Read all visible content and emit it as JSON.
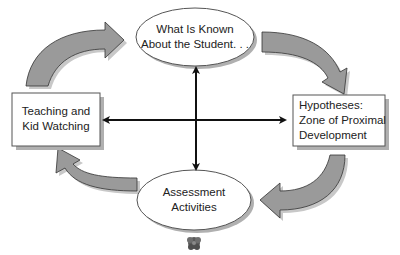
{
  "diagram": {
    "nodes": {
      "top": {
        "lines": [
          "What Is Known",
          "About the Student. . ."
        ],
        "shape": "ellipse"
      },
      "left": {
        "lines": [
          "Teaching and",
          "Kid Watching"
        ],
        "shape": "rectangle"
      },
      "right": {
        "lines": [
          "Hypotheses:",
          "Zone of Proximal",
          "Development"
        ],
        "shape": "rectangle"
      },
      "bottom": {
        "lines": [
          "Assessment",
          "Activities"
        ],
        "shape": "ellipse"
      }
    },
    "cycle_arrows": [
      {
        "from": "left",
        "to": "top",
        "direction": "clockwise"
      },
      {
        "from": "top",
        "to": "right",
        "direction": "clockwise"
      },
      {
        "from": "right",
        "to": "bottom",
        "direction": "clockwise"
      },
      {
        "from": "bottom",
        "to": "left",
        "direction": "clockwise"
      }
    ],
    "cross_arrows": [
      {
        "between": [
          "top",
          "bottom"
        ],
        "type": "double-headed"
      },
      {
        "between": [
          "left",
          "right"
        ],
        "type": "double-headed"
      }
    ],
    "colors": {
      "arrow_fill": "#9a9a9a",
      "arrow_shadow": "#c8c8c8",
      "node_fill": "#ffffff",
      "node_stroke": "#555555",
      "node_shadow": "#b0b0b0",
      "cross_arrow": "#111111"
    }
  }
}
